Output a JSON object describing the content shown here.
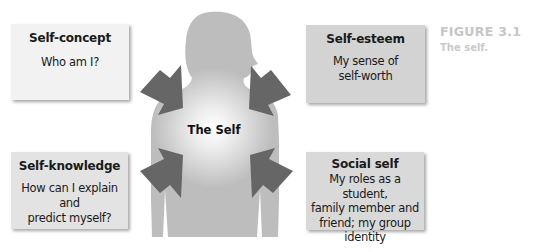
{
  "figure": {
    "label": "FIGURE 3.1",
    "caption": "The self."
  },
  "center": {
    "label": "The Self"
  },
  "boxes": {
    "self_concept": {
      "title": "Self-concept",
      "body": "Who am I?"
    },
    "self_esteem": {
      "title": "Self-esteem",
      "body_lines": [
        "My sense of",
        "self-worth"
      ]
    },
    "self_knowledge": {
      "title": "Self-knowledge",
      "body_lines": [
        "How can I explain and",
        "predict myself?"
      ]
    },
    "social_self": {
      "title": "Social self",
      "body_lines": [
        "My roles as a student,",
        "family member and",
        "friend; my group",
        "identity"
      ]
    }
  },
  "colors": {
    "silhouette": "#bdbdbd",
    "arrow": "#666666",
    "figure_label": "#c6c6c6",
    "box_concept": "#f2f2f2",
    "box_esteem": "#d3d3d3",
    "box_knowledge": "#e3e3e3",
    "box_social": "#d9d9d9"
  }
}
